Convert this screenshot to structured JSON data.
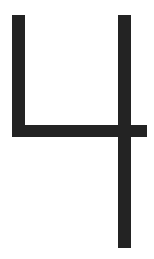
{
  "glyph": {
    "character": "4",
    "color": "#232323",
    "background": "#ffffff",
    "strokes": {
      "left_vertical": {
        "left": 12,
        "top": 15,
        "width": 13,
        "height": 122
      },
      "right_vertical": {
        "left": 118,
        "top": 15,
        "width": 13,
        "height": 233
      },
      "crossbar": {
        "left": 12,
        "top": 125,
        "width": 135,
        "height": 12
      }
    }
  }
}
